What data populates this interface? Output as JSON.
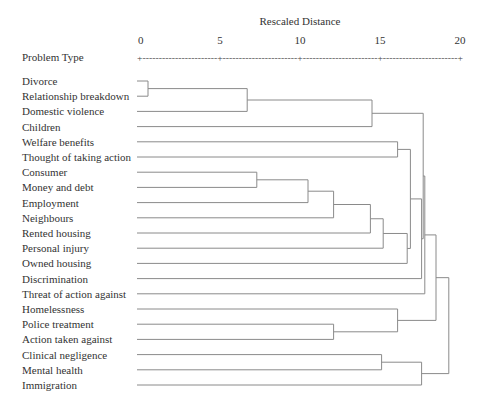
{
  "chart_data": {
    "type": "dendrogram",
    "title": "",
    "xlabel": "Rescaled Distance",
    "row_header": "Problem Type",
    "xlim": [
      0,
      20
    ],
    "x_ticks": [
      0,
      5,
      10,
      15,
      20
    ],
    "x_tick_labels": [
      "0",
      "5",
      "10",
      "15",
      "20"
    ],
    "axis_dash_pattern": "+-----------------------+-----------------------+-----------------------+-----------------------+",
    "leaves": [
      "Divorce",
      "Relationship breakdown",
      "Domestic violence",
      "Children",
      "Welfare benefits",
      "Thought of taking action",
      "Consumer",
      "Money and debt",
      "Employment",
      "Neighbours",
      "Rented housing",
      "Personal injury",
      "Owned housing",
      "Discrimination",
      "Threat of action against",
      "Homelessness",
      "Police treatment",
      "Action taken against",
      "Clinical negligence",
      "Mental health",
      "Immigration"
    ],
    "merges": [
      {
        "id": "m1",
        "a": "L0",
        "b": "L1",
        "distance": 0.5
      },
      {
        "id": "m2",
        "a": "m1",
        "b": "L2",
        "distance": 6.7
      },
      {
        "id": "m3",
        "a": "m2",
        "b": "L3",
        "distance": 14.5
      },
      {
        "id": "m4",
        "a": "L4",
        "b": "L5",
        "distance": 16.1
      },
      {
        "id": "m5",
        "a": "L6",
        "b": "L7",
        "distance": 7.3
      },
      {
        "id": "m6",
        "a": "m5",
        "b": "L8",
        "distance": 10.5
      },
      {
        "id": "m7",
        "a": "m6",
        "b": "L9",
        "distance": 12.1
      },
      {
        "id": "m8",
        "a": "m7",
        "b": "L10",
        "distance": 14.4
      },
      {
        "id": "m9",
        "a": "m8",
        "b": "L11",
        "distance": 15.2
      },
      {
        "id": "m10",
        "a": "m9",
        "b": "L12",
        "distance": 16.7
      },
      {
        "id": "m11",
        "a": "m4",
        "b": "m10",
        "distance": 16.9
      },
      {
        "id": "m12",
        "a": "m11",
        "b": "L13",
        "distance": 17.6
      },
      {
        "id": "m13",
        "a": "m3",
        "b": "m12",
        "distance": 17.7
      },
      {
        "id": "m14",
        "a": "m13",
        "b": "L14",
        "distance": 17.8
      },
      {
        "id": "m15",
        "a": "L16",
        "b": "L17",
        "distance": 12.1
      },
      {
        "id": "m16",
        "a": "L15",
        "b": "m15",
        "distance": 16.1
      },
      {
        "id": "m17",
        "a": "L18",
        "b": "L19",
        "distance": 15.1
      },
      {
        "id": "m18",
        "a": "m17",
        "b": "L20",
        "distance": 17.6
      },
      {
        "id": "m19",
        "a": "m14",
        "b": "m16",
        "distance": 18.5
      },
      {
        "id": "m20",
        "a": "m19",
        "b": "m18",
        "distance": 19.3
      }
    ]
  }
}
